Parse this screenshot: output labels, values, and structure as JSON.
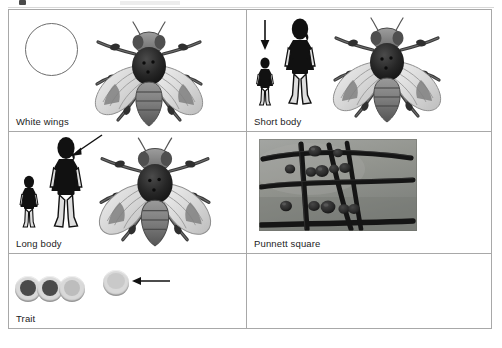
{
  "page": {
    "width": 502,
    "height": 348,
    "background": "#ffffff",
    "border_color": "#a8a8a8",
    "text_color": "#1c1c1c"
  },
  "top_remnant": {
    "present": true,
    "description": "faint cut-off bottom edge of a previous table row"
  },
  "table": {
    "columns": 2,
    "rows": 3,
    "cells": [
      {
        "position": "row1-col1",
        "label": "White wings",
        "empty": false,
        "contents": [
          {
            "type": "circle-outline",
            "name": "white-wings-circle",
            "fill": "#ffffff",
            "stroke": "#6d6d6d"
          },
          {
            "type": "fly-illustration",
            "name": "fruit-fly-illustration",
            "wing_tone": "light"
          }
        ]
      },
      {
        "position": "row1-col2",
        "label": "Short body",
        "empty": false,
        "contents": [
          {
            "type": "arrow",
            "name": "down-arrow-icon",
            "direction": "down",
            "color": "#111111"
          },
          {
            "type": "person-silhouette",
            "name": "short-person-silhouette",
            "size": "short",
            "color": "#111111"
          },
          {
            "type": "person-silhouette",
            "name": "tall-person-silhouette",
            "size": "tall",
            "color": "#111111"
          },
          {
            "type": "fly-illustration",
            "name": "fruit-fly-illustration",
            "wing_tone": "light"
          }
        ]
      },
      {
        "position": "row2-col1",
        "label": "Long body",
        "empty": false,
        "contents": [
          {
            "type": "person-silhouette",
            "name": "short-person-silhouette",
            "size": "short",
            "color": "#111111"
          },
          {
            "type": "person-silhouette",
            "name": "tall-person-silhouette",
            "size": "tall",
            "color": "#111111"
          },
          {
            "type": "arrow",
            "name": "pointer-arrow-icon",
            "direction": "down-left",
            "color": "#111111"
          },
          {
            "type": "fly-illustration",
            "name": "fruit-fly-illustration",
            "wing_tone": "light"
          }
        ]
      },
      {
        "position": "row2-col2",
        "label": "Punnett square",
        "empty": false,
        "contents": [
          {
            "type": "photograph",
            "name": "punnett-square-photo",
            "description": "grid of dark sticks on gray background with dark round beans in cells",
            "background": "#8f9290",
            "stick_color": "#1d1d1d",
            "bean_color": "#2a2a2a",
            "grid_lines": {
              "horizontal": 3,
              "vertical": 3
            }
          }
        ]
      },
      {
        "position": "row3-col1",
        "label": "Trait",
        "empty": false,
        "contents": [
          {
            "type": "disc",
            "name": "trait-disc-dark-1",
            "core": "#4a4a4a",
            "rim": "#d9d9d9"
          },
          {
            "type": "disc",
            "name": "trait-disc-dark-2",
            "core": "#4a4a4a",
            "rim": "#d9d9d9"
          },
          {
            "type": "disc",
            "name": "trait-disc-light-1",
            "core": "#bdbdbd",
            "rim": "#d9d9d9"
          },
          {
            "type": "disc",
            "name": "trait-disc-light-selected",
            "core": "#c9c9c9",
            "rim": "#dcdcdc"
          },
          {
            "type": "arrow",
            "name": "pointer-arrow-icon",
            "direction": "left",
            "color": "#111111"
          }
        ]
      },
      {
        "position": "row3-col2",
        "label": "",
        "empty": true,
        "contents": []
      }
    ]
  }
}
